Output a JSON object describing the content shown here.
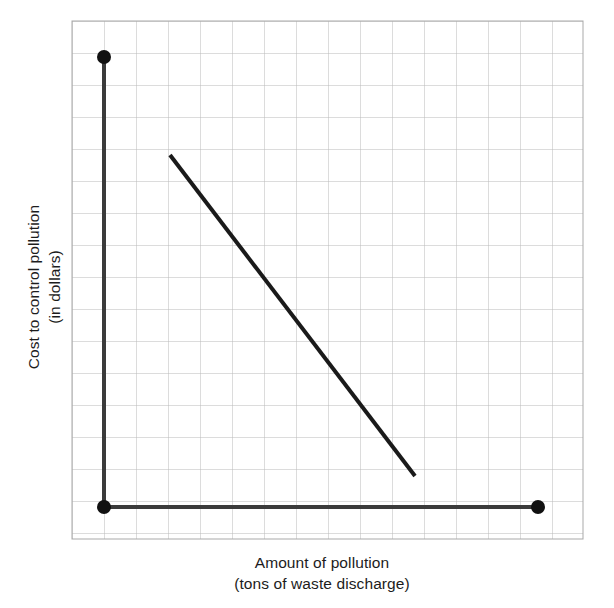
{
  "chart_data": {
    "type": "line",
    "title": "",
    "xlabel": "Amount of pollution",
    "xlabel_sub": "(tons of waste discharge)",
    "ylabel": "Cost to control pollution",
    "ylabel_sub": "(in dollars)",
    "grid": true,
    "grid_columns": 16,
    "grid_rows": 16,
    "grid_cell_px": 32,
    "axis_tick_labels_x": [],
    "axis_tick_labels_y": [],
    "legend": [],
    "annotations": [],
    "series": [
      {
        "name": "cost-to-control-pollution-line",
        "type": "line",
        "x": [
          3,
          11
        ],
        "y": [
          12,
          2
        ],
        "points_px": [
          [
            170,
            155
          ],
          [
            415,
            476
          ]
        ],
        "color": "#1a1a1a",
        "width_px": 4
      }
    ],
    "axes": {
      "x_axis": {
        "from_px": [
          104,
          507
        ],
        "to_px": [
          538,
          507
        ],
        "color": "#3b3b3b",
        "width_px": 4
      },
      "y_axis": {
        "from_px": [
          104,
          57
        ],
        "to_px": [
          104,
          507
        ],
        "color": "#3b3b3b",
        "width_px": 4
      }
    },
    "markers": [
      {
        "name": "y-axis-top-endpoint",
        "px": [
          104,
          57
        ],
        "radius_px": 7,
        "color": "#111111"
      },
      {
        "name": "origin-endpoint",
        "px": [
          104,
          507
        ],
        "radius_px": 7,
        "color": "#111111"
      },
      {
        "name": "x-axis-right-endpoint",
        "px": [
          538,
          507
        ],
        "radius_px": 7,
        "color": "#111111"
      }
    ],
    "colors": {
      "grid": "#b9b9b9",
      "grid_border": "#a9a9a9",
      "axis": "#3b3b3b",
      "line": "#1a1a1a",
      "marker": "#111111",
      "text": "#1c1c1c",
      "background": "#ffffff"
    },
    "plot_area_px": {
      "left": 72,
      "top": 21,
      "right": 583,
      "bottom": 539
    }
  },
  "labels": {
    "x_primary": "Amount of pollution",
    "x_secondary": "(tons of waste discharge)",
    "y_primary": "Cost to control pollution",
    "y_secondary": "(in dollars)"
  }
}
